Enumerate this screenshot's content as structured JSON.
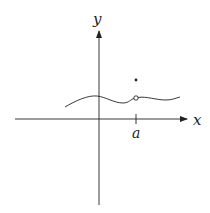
{
  "diagram": {
    "type": "function-graph-removable-discontinuity",
    "axes": {
      "x_label": "x",
      "y_label": "y"
    },
    "tick_label": "a",
    "features": {
      "curve": "smooth wavy function",
      "open_circle": "hole in curve at x = a",
      "filled_point": "isolated point above the hole at x = a"
    },
    "colors": {
      "line": "#222222",
      "background": "#ffffff"
    }
  }
}
